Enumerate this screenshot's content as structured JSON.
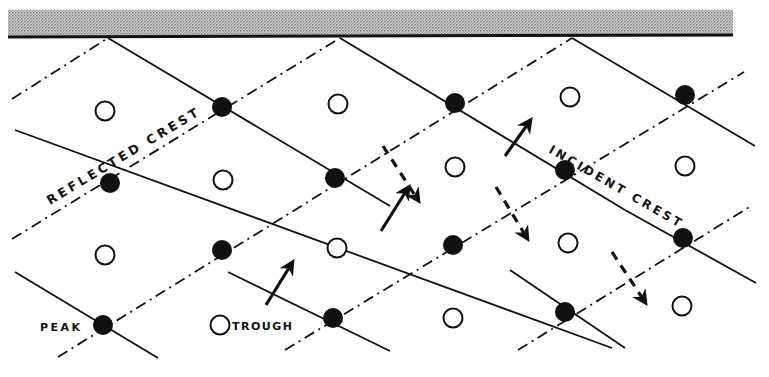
{
  "diagram": {
    "title": "",
    "labels": {
      "reflected_crest": "REFLECTED CREST",
      "incident_crest": "INCIDENT CREST",
      "peak": "PEAK",
      "trough": "TROUGH"
    },
    "wall": {
      "x1": 8,
      "x2": 733,
      "y_top": 10,
      "y_bottom": 38,
      "fill": "#bdbdbd",
      "edge": "#111111"
    },
    "colors": {
      "ink": "#111111",
      "background": "#ffffff"
    },
    "incident_crest_lines": [
      {
        "x1": 108,
        "y1": 38,
        "x2": 390,
        "y2": 206
      },
      {
        "x1": 340,
        "y1": 38,
        "x2": 625,
        "y2": 210
      },
      {
        "x1": 572,
        "y1": 38,
        "x2": 755,
        "y2": 146
      },
      {
        "x1": 15,
        "y1": 130,
        "x2": 612,
        "y2": 348
      },
      {
        "x1": 15,
        "y1": 272,
        "x2": 158,
        "y2": 358
      },
      {
        "x1": 228,
        "y1": 272,
        "x2": 390,
        "y2": 351
      },
      {
        "x1": 510,
        "y1": 270,
        "x2": 625,
        "y2": 348
      },
      {
        "x1": 625,
        "y1": 210,
        "x2": 756,
        "y2": 283
      }
    ],
    "reflected_crest_lines": [
      {
        "x1": 12,
        "y1": 99,
        "x2": 108,
        "y2": 38
      },
      {
        "x1": 12,
        "y1": 239,
        "x2": 340,
        "y2": 38
      },
      {
        "x1": 58,
        "y1": 357,
        "x2": 572,
        "y2": 38
      },
      {
        "x1": 285,
        "y1": 350,
        "x2": 744,
        "y2": 72
      },
      {
        "x1": 518,
        "y1": 350,
        "x2": 751,
        "y2": 206
      }
    ],
    "peaks": [
      {
        "x": 222,
        "y": 107
      },
      {
        "x": 455,
        "y": 103
      },
      {
        "x": 685,
        "y": 95
      },
      {
        "x": 110,
        "y": 183
      },
      {
        "x": 335,
        "y": 178
      },
      {
        "x": 565,
        "y": 170
      },
      {
        "x": 222,
        "y": 250
      },
      {
        "x": 453,
        "y": 245
      },
      {
        "x": 683,
        "y": 238
      },
      {
        "x": 103,
        "y": 325
      },
      {
        "x": 333,
        "y": 318
      },
      {
        "x": 565,
        "y": 312
      }
    ],
    "troughs": [
      {
        "x": 105,
        "y": 111
      },
      {
        "x": 338,
        "y": 104
      },
      {
        "x": 570,
        "y": 97
      },
      {
        "x": 223,
        "y": 180
      },
      {
        "x": 455,
        "y": 167
      },
      {
        "x": 685,
        "y": 166
      },
      {
        "x": 105,
        "y": 255
      },
      {
        "x": 337,
        "y": 248
      },
      {
        "x": 568,
        "y": 243
      },
      {
        "x": 220,
        "y": 325
      },
      {
        "x": 453,
        "y": 318
      },
      {
        "x": 682,
        "y": 306
      }
    ],
    "incident_arrows": [
      {
        "x1": 266,
        "y1": 305,
        "x2": 292,
        "y2": 263
      },
      {
        "x1": 381,
        "y1": 231,
        "x2": 408,
        "y2": 188
      },
      {
        "x1": 505,
        "y1": 156,
        "x2": 530,
        "y2": 121
      }
    ],
    "reflected_arrows": [
      {
        "x1": 383,
        "y1": 146,
        "x2": 418,
        "y2": 200
      },
      {
        "x1": 496,
        "y1": 187,
        "x2": 527,
        "y2": 238
      },
      {
        "x1": 612,
        "y1": 252,
        "x2": 645,
        "y2": 302
      }
    ],
    "label_positions": {
      "reflected_crest": {
        "x": 50,
        "y": 205,
        "angle": -31
      },
      "incident_crest": {
        "x": 548,
        "y": 152,
        "angle": 30
      },
      "peak": {
        "x": 40,
        "y": 331
      },
      "trough": {
        "x": 232,
        "y": 330
      },
      "trough_symbol": {
        "x": 220,
        "y": 325
      }
    }
  }
}
